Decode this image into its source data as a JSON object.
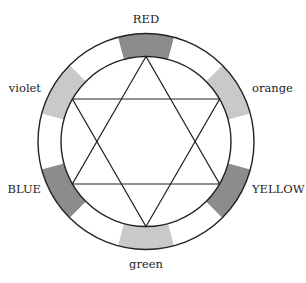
{
  "diagram": {
    "type": "color-wheel-hexagram",
    "center": [
      146,
      141.5
    ],
    "outer_radius": 108,
    "inner_radius": 85,
    "segment_half_angle_deg": 15,
    "colors": {
      "primary_fill": "#8c8c8c",
      "secondary_fill": "#c9c9c9",
      "stroke": "#222222"
    },
    "segments": [
      {
        "name": "RED",
        "angle_deg": 90,
        "kind": "primary",
        "label": "RED",
        "label_pos": [
          146,
          23
        ],
        "anchor": "middle"
      },
      {
        "name": "orange",
        "angle_deg": 30,
        "kind": "secondary",
        "label": "orange",
        "label_pos": [
          252,
          92
        ],
        "anchor": "start"
      },
      {
        "name": "YELLOW",
        "angle_deg": -30,
        "kind": "primary",
        "label": "YELLOW",
        "label_pos": [
          252,
          193
        ],
        "anchor": "start"
      },
      {
        "name": "green",
        "angle_deg": -90,
        "kind": "secondary",
        "label": "green",
        "label_pos": [
          146,
          268
        ],
        "anchor": "middle"
      },
      {
        "name": "BLUE",
        "angle_deg": -150,
        "kind": "primary",
        "label": "BLUE",
        "label_pos": [
          41,
          193
        ],
        "anchor": "end"
      },
      {
        "name": "violet",
        "angle_deg": 150,
        "kind": "secondary",
        "label": "violet",
        "label_pos": [
          41,
          92
        ],
        "anchor": "end"
      }
    ]
  }
}
